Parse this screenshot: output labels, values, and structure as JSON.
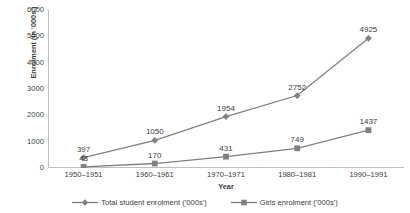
{
  "chart_data": {
    "type": "line",
    "title": "",
    "xlabel": "Year",
    "ylabel": "Enrolment (in '000s')",
    "categories": [
      "1950–1951",
      "1960–1961",
      "1970–1971",
      "1980–1981",
      "1990–1991"
    ],
    "series": [
      {
        "name": "Total student enrolment ('000s')",
        "values": [
          397,
          1050,
          1954,
          2752,
          4925
        ],
        "marker": "diamond",
        "color": "#808080"
      },
      {
        "name": "Girls enrolment ('000s')",
        "values": [
          43,
          170,
          431,
          749,
          1437
        ],
        "marker": "square",
        "color": "#808080"
      }
    ],
    "ylim": [
      0,
      6000
    ],
    "yticks": [
      0,
      1000,
      2000,
      3000,
      4000,
      5000,
      6000
    ],
    "ytick_labels": [
      "0",
      "1000",
      "2000",
      "3000",
      "4000",
      "5000",
      "6000"
    ],
    "grid": false,
    "legend_position": "bottom",
    "data_labels_shown": true
  },
  "colors": {
    "axis": "#bfbfbf",
    "series_line": "#808080",
    "text": "#3d3d3d",
    "background": "#ffffff"
  },
  "legend": {
    "items": [
      {
        "label": "Total student enrolment ('000s')",
        "marker": "diamond"
      },
      {
        "label": "Girls enrolment ('000s')",
        "marker": "square"
      }
    ]
  }
}
